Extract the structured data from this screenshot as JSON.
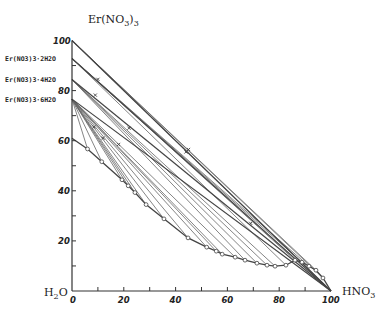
{
  "chart_data": {
    "type": "line",
    "title": "",
    "subtitle": "Er(NO3)3 – HNO3 – H2O ternary solubility diagram (right-triangle representation)",
    "xlabel": "HNO3",
    "ylabel": "Er(NO3)3",
    "origin_label": "H2O",
    "xlim": [
      0,
      100
    ],
    "ylim": [
      0,
      100
    ],
    "x_ticks": [
      0,
      20,
      40,
      60,
      80,
      100
    ],
    "y_ticks": [
      0,
      20,
      40,
      60,
      80,
      100
    ],
    "x_tick_labels": [
      "0",
      "20",
      "40",
      "60",
      "80",
      "100"
    ],
    "y_tick_labels": [
      "20",
      "40",
      "60",
      "80",
      "100"
    ],
    "x_minor_ticks": [
      10,
      30,
      50,
      70,
      90
    ],
    "y_minor_ticks": [
      10,
      30,
      50,
      70,
      90
    ],
    "grid": false,
    "legend": "none",
    "hydrate_labels": [
      {
        "label": "Er(NO3)3·2H2O",
        "y": 92.8
      },
      {
        "label": "Er(NO3)3·4H2O",
        "y": 84.4
      },
      {
        "label": "Er(NO3)3·6H2O",
        "y": 76.6
      }
    ],
    "solid_phases": [
      {
        "name": "Er(NO3)3",
        "x": 0,
        "y": 100
      },
      {
        "name": "Er(NO3)3·2H2O",
        "x": 0,
        "y": 92.8
      },
      {
        "name": "Er(NO3)3·4H2O",
        "x": 0,
        "y": 84.4
      },
      {
        "name": "Er(NO3)3·6H2O",
        "x": 0,
        "y": 76.6
      }
    ],
    "series": [
      {
        "name": "solubility curve (liquid phase)",
        "marker": "open-circle",
        "points": [
          [
            0,
            61
          ],
          [
            6,
            56.7
          ],
          [
            11.5,
            51.6
          ],
          [
            19.3,
            44.4
          ],
          [
            21.7,
            42
          ],
          [
            24.3,
            39.3
          ],
          [
            28.6,
            34.5
          ],
          [
            35.5,
            28.8
          ],
          [
            44.8,
            21.2
          ],
          [
            52,
            17.5
          ],
          [
            55.7,
            15.9
          ],
          [
            58,
            14.7
          ],
          [
            63,
            13.5
          ],
          [
            66.8,
            12.3
          ],
          [
            71.4,
            11.1
          ],
          [
            75.3,
            10.3
          ],
          [
            78.4,
            9.9
          ],
          [
            82.6,
            10.3
          ],
          [
            86.1,
            12.3
          ],
          [
            88.8,
            11.5
          ],
          [
            91.5,
            9.9
          ],
          [
            94.2,
            8.3
          ],
          [
            96.9,
            5.2
          ],
          [
            100,
            0
          ]
        ]
      },
      {
        "name": "tie lines to Er(NO3)3·6H2O",
        "from": [
          0,
          76.6
        ],
        "to_x": [
          6,
          11.5,
          19.3,
          21.7,
          24.3,
          28.6,
          35.5,
          44.8,
          52,
          55.7,
          58,
          63
        ]
      },
      {
        "name": "tie lines to Er(NO3)3·4H2O",
        "from": [
          0,
          84.4
        ],
        "to_x": [
          66.8,
          71.4,
          75.3,
          78.4
        ]
      },
      {
        "name": "tie lines to Er(NO3)3·2H2O",
        "from": [
          0,
          92.8
        ],
        "to_x": [
          82.6,
          86.1,
          88.8,
          91.5
        ]
      },
      {
        "name": "tie lines to Er(NO3)3",
        "from": [
          0,
          100
        ],
        "to_x": [
          94.2,
          96.9,
          100
        ]
      }
    ],
    "wet_residue_points": [
      {
        "x": 8.5,
        "y": 65.5
      },
      {
        "x": 12,
        "y": 61
      },
      {
        "x": 18,
        "y": 58.5
      },
      {
        "x": 9,
        "y": 78.2
      },
      {
        "x": 22,
        "y": 65
      },
      {
        "x": 44,
        "y": 55.5
      },
      {
        "x": 10,
        "y": 84.5
      },
      {
        "x": 45,
        "y": 56.5
      },
      {
        "x": 69,
        "y": 27
      }
    ]
  },
  "axes": {
    "y_title": "Er(NO",
    "y_title_sub": "3",
    "y_title_tail": ")",
    "y_title_sub2": "3",
    "x_title": "HNO",
    "x_title_sub": "3",
    "origin_title": "H",
    "origin_sub": "2",
    "origin_tail": "O"
  },
  "colors": {
    "axis": "#333333",
    "line": "#444444",
    "tie": "#666666",
    "background": "#ffffff"
  }
}
